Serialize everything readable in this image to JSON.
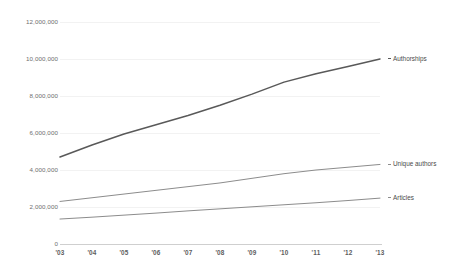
{
  "chart_data": {
    "type": "line",
    "title": "",
    "xlabel": "",
    "ylabel": "",
    "x": [
      "'03",
      "'04",
      "'05",
      "'06",
      "'07",
      "'08",
      "'09",
      "'10",
      "'11",
      "'12",
      "'13"
    ],
    "categories": [
      "'03",
      "'04",
      "'05",
      "'06",
      "'07",
      "'08",
      "'09",
      "'10",
      "'11",
      "'12",
      "'13"
    ],
    "ylim": [
      0,
      12000000
    ],
    "yticks": [
      0,
      2000000,
      4000000,
      6000000,
      8000000,
      10000000,
      12000000
    ],
    "ytick_labels": [
      "0",
      "2,000,000",
      "4,000,000",
      "6,000,000",
      "8,000,000",
      "10,000,000",
      "12,000,000"
    ],
    "grid": true,
    "legend_position": "right-inline",
    "series": [
      {
        "name": "Authorships",
        "color": "#595959",
        "width": 1.5,
        "values": [
          4700000,
          5350000,
          5950000,
          6450000,
          6950000,
          7500000,
          8100000,
          8750000,
          9200000,
          9600000,
          10000000
        ]
      },
      {
        "name": "Unique authors",
        "color": "#8c8c8c",
        "width": 1,
        "values": [
          2300000,
          2500000,
          2700000,
          2900000,
          3100000,
          3300000,
          3550000,
          3800000,
          4000000,
          4150000,
          4300000
        ]
      },
      {
        "name": "Articles",
        "color": "#8c8c8c",
        "width": 1,
        "values": [
          1350000,
          1450000,
          1560000,
          1670000,
          1790000,
          1900000,
          2010000,
          2120000,
          2230000,
          2350000,
          2480000
        ]
      }
    ]
  },
  "axis": {
    "y_labels": [
      "12,000,000",
      "10,000,000",
      "8,000,000",
      "6,000,000",
      "4,000,000",
      "2,000,000",
      "0"
    ],
    "x_labels": [
      "'03",
      "'04",
      "'05",
      "'06",
      "'07",
      "'08",
      "'09",
      "'10",
      "'11",
      "'12",
      "'13"
    ]
  },
  "legend": [
    {
      "label": "Authorships"
    },
    {
      "label": "Unique authors"
    },
    {
      "label": "Articles"
    }
  ],
  "colors": {
    "series_dark": "#595959",
    "series_mid": "#8c8c8c",
    "gridline": "#f2f2f2",
    "axis": "#cfcfcf",
    "tick_text": "#6e6e6e",
    "background": "#ffffff"
  }
}
